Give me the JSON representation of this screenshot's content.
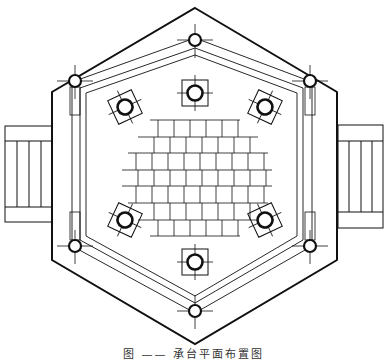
{
  "figure": {
    "caption": "图 —— 承台平面布置图",
    "stroke_color": "#111111",
    "background": "#ffffff",
    "elements": {
      "outer_hexagon": "outer-hexagon",
      "inner_frame": "inner-frame",
      "stairs": [
        "left-stairs",
        "right-stairs"
      ],
      "corner_piles": 6,
      "inner_columns": 6,
      "center_grid": "block-grid"
    }
  }
}
